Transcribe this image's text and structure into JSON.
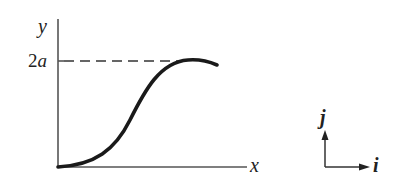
{
  "diagram": {
    "type": "curve-plot",
    "axes": {
      "y_label": "y",
      "x_label": "x",
      "y_tick_label": "2a"
    },
    "curve": {
      "description": "S-shaped curve rising from origin to maximum 2a, then slightly descending",
      "max_value_label": "2a"
    },
    "unit_vectors": {
      "vertical_label": "j",
      "horizontal_label": "i"
    },
    "colors": {
      "ink": "#1a1a1a",
      "axis": "#555555",
      "background": "#ffffff"
    }
  }
}
